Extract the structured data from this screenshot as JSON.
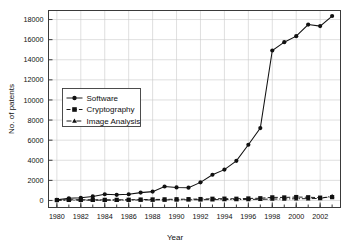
{
  "chart_data": {
    "type": "line",
    "title": "",
    "xlabel": "Year",
    "ylabel": "No. of patents",
    "xlim": [
      1979.3,
      2003.7
    ],
    "ylim": [
      -700,
      18900
    ],
    "grid": true,
    "legend_position": "upper-left-inside",
    "x": [
      1980,
      1981,
      1982,
      1983,
      1984,
      1985,
      1986,
      1987,
      1988,
      1989,
      1990,
      1991,
      1992,
      1993,
      1994,
      1995,
      1996,
      1997,
      1998,
      1999,
      2000,
      2001,
      2002,
      2003
    ],
    "xticks": [
      1980,
      1982,
      1984,
      1986,
      1988,
      1990,
      1992,
      1994,
      1996,
      1998,
      2000,
      2002
    ],
    "xtick_labels": [
      "1980",
      "1982",
      "1984",
      "1986",
      "1988",
      "1990",
      "1992",
      "1994",
      "1996",
      "1998",
      "2000",
      "2002"
    ],
    "yticks": [
      0,
      2000,
      4000,
      6000,
      8000,
      10000,
      12000,
      14000,
      16000,
      18000
    ],
    "ytick_labels": [
      "0",
      "2000",
      "4000",
      "6000",
      "8000",
      "10000",
      "12000",
      "14000",
      "16000",
      "18000"
    ],
    "series": [
      {
        "name": "Software",
        "marker": "circle",
        "linestyle": "solid",
        "color": "#111111",
        "values": [
          60,
          210,
          260,
          400,
          620,
          560,
          620,
          780,
          880,
          1390,
          1300,
          1270,
          1800,
          2560,
          3070,
          3940,
          5540,
          7200,
          14920,
          15750,
          16350,
          17500,
          17350,
          18350
        ]
      },
      {
        "name": "Cryptography",
        "marker": "square",
        "linestyle": "dashed",
        "color": "#111111",
        "values": [
          40,
          70,
          70,
          60,
          60,
          60,
          70,
          90,
          100,
          110,
          120,
          130,
          140,
          170,
          180,
          170,
          200,
          220,
          310,
          300,
          340,
          320,
          280,
          330
        ]
      },
      {
        "name": "Image Analysis",
        "marker": "triangle",
        "linestyle": "dashdot",
        "color": "#111111",
        "values": [
          20,
          30,
          35,
          35,
          30,
          35,
          40,
          50,
          55,
          60,
          65,
          70,
          75,
          85,
          90,
          95,
          105,
          115,
          140,
          150,
          170,
          180,
          200,
          430
        ]
      }
    ]
  }
}
